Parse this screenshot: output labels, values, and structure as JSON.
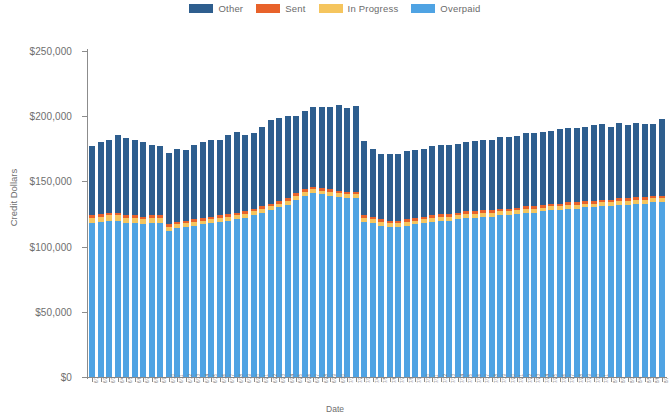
{
  "chart_data": {
    "type": "bar",
    "stacked": true,
    "title": "",
    "xlabel": "Date",
    "ylabel": "Credit Dollars",
    "ylim": [
      0,
      250000
    ],
    "ytick_labels": [
      "$0",
      "$50,000",
      "$100,000",
      "$150,000",
      "$200,000",
      "$250,000"
    ],
    "ytick_values": [
      0,
      50000,
      100000,
      150000,
      200000,
      250000
    ],
    "grid": false,
    "legend_position": "top-center",
    "series": [
      {
        "name": "Overpaid",
        "color": "#4FA3E3",
        "values": [
          118000,
          119000,
          120000,
          120000,
          118000,
          118000,
          117000,
          118000,
          118000,
          112000,
          114000,
          115000,
          116000,
          117000,
          118000,
          119000,
          120000,
          121000,
          122000,
          124000,
          126000,
          128000,
          130000,
          132000,
          136000,
          139000,
          141000,
          140000,
          139000,
          138000,
          137000,
          137000,
          119000,
          118000,
          116000,
          115000,
          115000,
          116000,
          117000,
          118000,
          119000,
          120000,
          120000,
          121000,
          122000,
          122000,
          123000,
          123000,
          124000,
          124000,
          125000,
          126000,
          126000,
          127000,
          128000,
          128000,
          129000,
          129000,
          130000,
          130000,
          131000,
          131000,
          132000,
          132000,
          133000,
          133000,
          134000,
          134000
        ]
      },
      {
        "name": "In Progress",
        "color": "#F5C55E",
        "values": [
          4000,
          4000,
          4000,
          4000,
          4000,
          4000,
          4000,
          4000,
          4000,
          3000,
          3000,
          3000,
          3000,
          3000,
          3000,
          3000,
          3000,
          3000,
          3000,
          3000,
          3000,
          3000,
          3000,
          3000,
          3000,
          3000,
          3000,
          3000,
          3000,
          3000,
          3000,
          3000,
          3000,
          3000,
          3000,
          3000,
          3000,
          3000,
          3000,
          3000,
          3000,
          3000,
          3000,
          3000,
          3000,
          3000,
          3000,
          3000,
          3000,
          3000,
          3000,
          3000,
          3000,
          3000,
          3000,
          3000,
          3000,
          3000,
          3000,
          3000,
          3000,
          3000,
          3000,
          3000,
          3000,
          3000,
          3000,
          3000
        ]
      },
      {
        "name": "Sent",
        "color": "#E8622A",
        "values": [
          2000,
          2000,
          2000,
          2000,
          2000,
          2000,
          2000,
          2000,
          2000,
          2000,
          2000,
          2000,
          2000,
          2000,
          2000,
          2000,
          2000,
          2000,
          2000,
          2000,
          2000,
          2000,
          2000,
          2000,
          2000,
          2000,
          2000,
          2000,
          2000,
          2000,
          2000,
          2000,
          2000,
          2000,
          2000,
          2000,
          2000,
          2000,
          2000,
          2000,
          2000,
          2000,
          2000,
          2000,
          2000,
          2000,
          2000,
          2000,
          2000,
          2000,
          2000,
          2000,
          2000,
          2000,
          2000,
          2000,
          2000,
          2000,
          2000,
          2000,
          2000,
          2000,
          2000,
          2000,
          2000,
          2000,
          2000,
          2000
        ]
      },
      {
        "name": "Other",
        "color": "#2E5E8E",
        "values": [
          53000,
          55000,
          56000,
          60000,
          59000,
          58000,
          57000,
          54000,
          53000,
          55000,
          56000,
          54000,
          57000,
          58000,
          59000,
          58000,
          61000,
          62000,
          59000,
          58000,
          61000,
          64000,
          64000,
          63000,
          59000,
          60000,
          61000,
          62000,
          63000,
          66000,
          64000,
          66000,
          57000,
          52000,
          50000,
          51000,
          51000,
          52000,
          52000,
          52000,
          53000,
          53000,
          53000,
          53000,
          53000,
          54000,
          54000,
          54000,
          55000,
          55000,
          55000,
          56000,
          56000,
          56000,
          56000,
          57000,
          57000,
          57000,
          57000,
          58000,
          58000,
          56000,
          58000,
          56000,
          57000,
          56000,
          55000,
          59000
        ]
      }
    ],
    "bar_totals": [
      177000,
      180000,
      182000,
      186000,
      183000,
      182000,
      180000,
      178000,
      177000,
      172000,
      175000,
      174000,
      178000,
      180000,
      182000,
      182000,
      186000,
      188000,
      186000,
      187000,
      192000,
      197000,
      199000,
      200000,
      200000,
      204000,
      207000,
      207000,
      207000,
      209000,
      206000,
      208000,
      181000,
      175000,
      171000,
      171000,
      171000,
      173000,
      174000,
      175000,
      177000,
      178000,
      178000,
      179000,
      180000,
      181000,
      182000,
      182000,
      184000,
      184000,
      185000,
      187000,
      187000,
      188000,
      189000,
      190000,
      191000,
      191000,
      192000,
      193000,
      194000,
      192000,
      195000,
      193000,
      195000,
      194000,
      194000,
      198000
    ],
    "categories": [
      "6/1",
      "6/2",
      "6/3",
      "6/4",
      "6/5",
      "6/6",
      "6/7",
      "6/8",
      "6/9",
      "6/10",
      "6/11",
      "6/12",
      "6/13",
      "6/14",
      "6/15",
      "6/16",
      "6/17",
      "6/18",
      "6/19",
      "6/20",
      "6/21",
      "6/22",
      "6/23",
      "6/24",
      "6/25",
      "6/26",
      "6/27",
      "6/28",
      "6/29",
      "6/30",
      "7/1",
      "7/2",
      "7/3",
      "7/4",
      "7/5",
      "7/6",
      "7/7",
      "7/8",
      "7/9",
      "7/10",
      "7/11",
      "7/12",
      "7/13",
      "7/14",
      "7/15",
      "7/16",
      "7/17",
      "7/18",
      "7/19",
      "7/20",
      "7/21",
      "7/22",
      "7/23",
      "7/24",
      "7/25",
      "7/26",
      "7/27",
      "7/28",
      "7/29",
      "7/30",
      "7/31",
      "8/1",
      "8/2",
      "8/3",
      "8/4",
      "8/5",
      "8/6",
      "8/7"
    ]
  },
  "legend": {
    "items": [
      {
        "label": "Other",
        "color": "#2E5E8E"
      },
      {
        "label": "Sent",
        "color": "#E8622A"
      },
      {
        "label": "In Progress",
        "color": "#F5C55E"
      },
      {
        "label": "Overpaid",
        "color": "#4FA3E3"
      }
    ]
  },
  "axes": {
    "y_title": "Credit Dollars",
    "x_title": "Date"
  }
}
